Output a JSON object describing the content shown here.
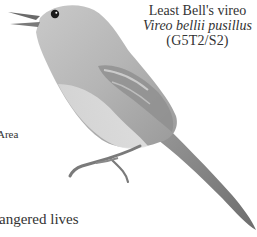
{
  "species": {
    "common_name": "Least Bell's vireo",
    "scientific_name": "Vireo bellii pusillus",
    "status_rank": "(G5T2/S2)"
  },
  "illustration": {
    "subject": "bird-illustration",
    "description": "Grayscale drawing of a Least Bell's vireo perched, beak open, facing left"
  },
  "text_fragments": {
    "area": "Area",
    "endangered": "angered lives"
  }
}
